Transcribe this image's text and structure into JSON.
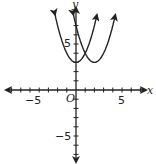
{
  "chart_data": {
    "type": "line",
    "title": "",
    "xlabel": "x",
    "ylabel": "y",
    "origin_label": "O",
    "xlim": [
      -8,
      8
    ],
    "ylim": [
      -9,
      8
    ],
    "x_tick_labels": [
      "-5",
      "5"
    ],
    "y_tick_labels": [
      "5",
      "-5"
    ],
    "grid": false,
    "series": [
      {
        "name": "parabola-1",
        "vertex": [
          0,
          3
        ],
        "equation": "y = x^2 + 3"
      },
      {
        "name": "parabola-2",
        "vertex": [
          2,
          3
        ],
        "equation": "y = (x-2)^2 + 3"
      }
    ]
  },
  "labels": {
    "x_axis": "x",
    "y_axis": "y",
    "origin": "O",
    "x_neg5": "−5",
    "x_pos5": "5",
    "y_pos5": "5",
    "y_neg5": "−5"
  }
}
